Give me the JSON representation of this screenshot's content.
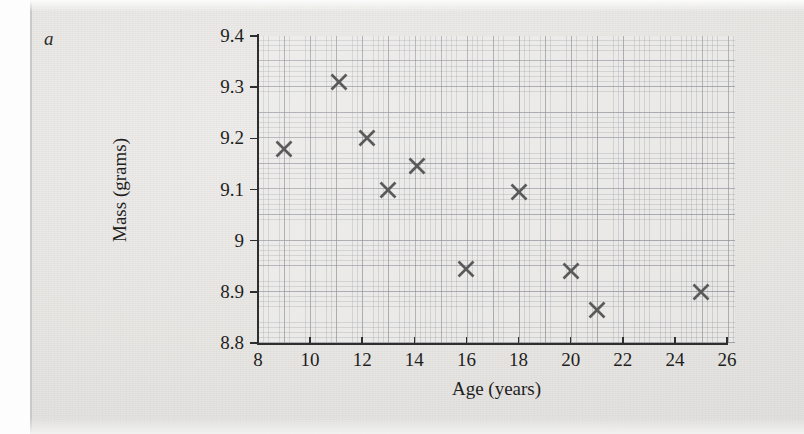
{
  "panel": {
    "label": "a"
  },
  "chart_data": {
    "type": "scatter",
    "title": "",
    "xlabel": "Age (years)",
    "ylabel": "Mass (grams)",
    "xlim": [
      8,
      26
    ],
    "ylim": [
      8.8,
      9.4
    ],
    "xticks": [
      8,
      10,
      12,
      14,
      16,
      18,
      20,
      22,
      24,
      26
    ],
    "xtick_labels": [
      "8",
      "10",
      "12",
      "14",
      "16",
      "18",
      "20",
      "22",
      "24",
      "26"
    ],
    "yticks": [
      8.8,
      8.9,
      9.0,
      9.1,
      9.2,
      9.3,
      9.4
    ],
    "ytick_labels": [
      "8.8",
      "8.9",
      "9",
      "9.1",
      "9.2",
      "9.3",
      "9.4"
    ],
    "grid": true,
    "grid_style": "graph-paper",
    "legend": "none",
    "marker": "x-cross",
    "marker_color": "#5a5a5a",
    "x": [
      9,
      11.1,
      12.2,
      13,
      14.1,
      16,
      18,
      20,
      21,
      25
    ],
    "y": [
      9.18,
      9.31,
      9.2,
      9.1,
      9.145,
      8.945,
      9.095,
      8.94,
      8.865,
      8.9
    ],
    "points": [
      {
        "x": 9,
        "y": 9.18
      },
      {
        "x": 11.1,
        "y": 9.31
      },
      {
        "x": 12.2,
        "y": 9.2
      },
      {
        "x": 13,
        "y": 9.1
      },
      {
        "x": 14.1,
        "y": 9.145
      },
      {
        "x": 16,
        "y": 8.945
      },
      {
        "x": 18,
        "y": 9.095
      },
      {
        "x": 20,
        "y": 8.94
      },
      {
        "x": 21,
        "y": 8.865
      },
      {
        "x": 25,
        "y": 8.9
      }
    ]
  },
  "colors": {
    "axis": "#2e2e2e",
    "marker": "#5a5a5a",
    "paper": "#e8e8e6",
    "grid_major": "#5f6470",
    "grid_minor": "#787d87"
  }
}
